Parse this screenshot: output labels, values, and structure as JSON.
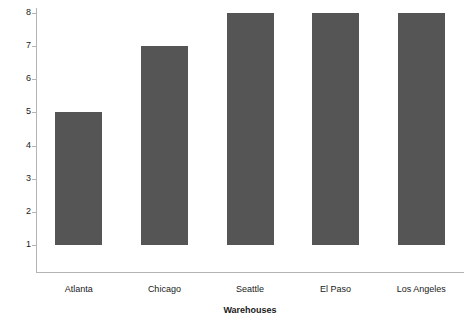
{
  "chart_data": {
    "type": "bar",
    "title": "",
    "categories": [
      "Atlanta",
      "Chicago",
      "Seattle",
      "El Paso",
      "Los Angeles"
    ],
    "values": [
      5,
      7,
      8,
      8,
      8
    ],
    "series": [
      {
        "name": "Warehouses",
        "values": [
          5,
          7,
          8,
          8,
          8
        ]
      }
    ],
    "xlabel": "Warehouses",
    "ylabel": "",
    "ylim": [
      1,
      8
    ],
    "y_ticks": [
      1,
      2,
      3,
      4,
      5,
      6,
      7,
      8
    ],
    "y_tick_labels": [
      "1",
      "2",
      "3",
      "4",
      "5",
      "6",
      "7",
      "8"
    ],
    "bar_baseline": 1,
    "grid": false,
    "legend": false,
    "legend_position": "none",
    "bar_color": "#555555",
    "axis_color": "#b4b4b4",
    "background_color": "#ffffff",
    "text_color": "#1a1a1a"
  },
  "axes": {
    "x_title": "Warehouses",
    "y_title": ""
  }
}
